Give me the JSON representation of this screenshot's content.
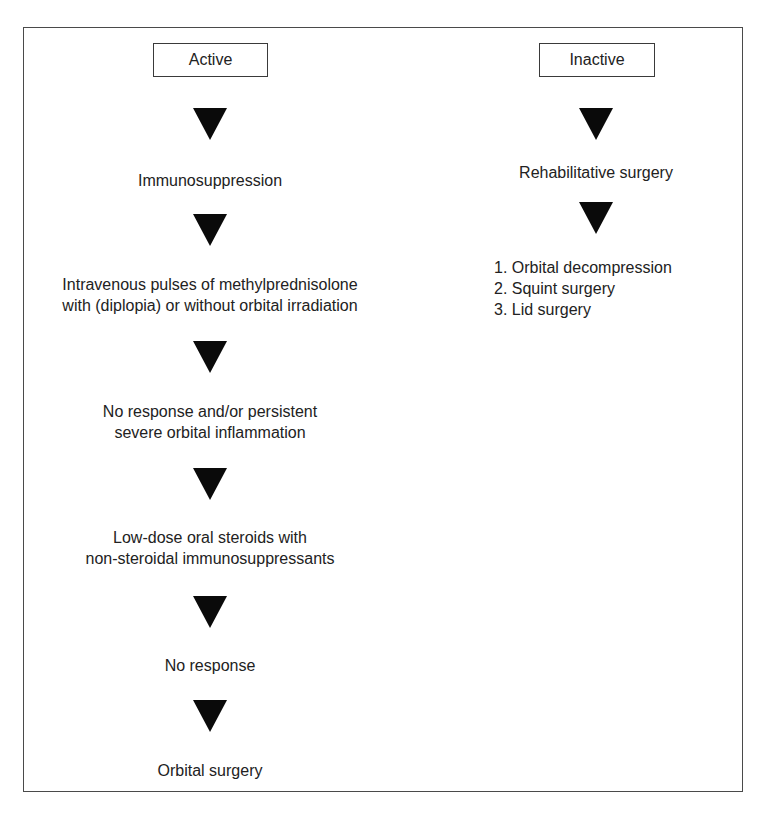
{
  "diagram": {
    "columns": [
      {
        "header": "Active",
        "steps": [
          {
            "lines": [
              "Immunosuppression"
            ]
          },
          {
            "lines": [
              "Intravenous pulses of methylprednisolone",
              "with (diplopia) or without orbital irradiation"
            ]
          },
          {
            "lines": [
              "No response and/or persistent",
              "severe orbital inflammation"
            ]
          },
          {
            "lines": [
              "Low-dose oral steroids with",
              "non-steroidal immunosuppressants"
            ]
          },
          {
            "lines": [
              "No response"
            ]
          },
          {
            "lines": [
              "Orbital surgery"
            ]
          }
        ]
      },
      {
        "header": "Inactive",
        "steps": [
          {
            "lines": [
              "Rehabilitative surgery"
            ]
          }
        ],
        "list": [
          "1. Orbital decompression",
          "2. Squint surgery",
          "3. Lid surgery"
        ]
      }
    ],
    "colors": {
      "arrow": "#0a0a0a",
      "text": "#222222",
      "border": "#4a4a4a",
      "background": "#ffffff"
    }
  }
}
